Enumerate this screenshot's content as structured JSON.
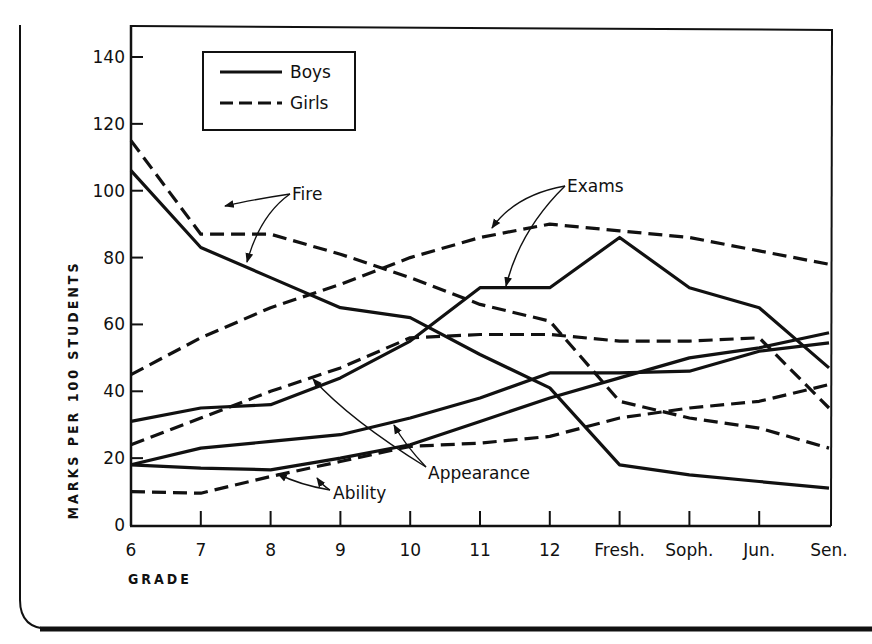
{
  "chart_data": {
    "type": "line",
    "title": "",
    "xlabel": "GRADE",
    "ylabel": "MARKS PER 100 STUDENTS",
    "ylim": [
      0,
      140
    ],
    "yticks": [
      0,
      20,
      40,
      60,
      80,
      100,
      120,
      140
    ],
    "categories": [
      "6",
      "7",
      "8",
      "9",
      "10",
      "11",
      "12",
      "Fresh.",
      "Soph.",
      "Jun.",
      "Sen."
    ],
    "grid": false,
    "legend": {
      "position": "upper-left",
      "entries": [
        {
          "label": "Boys",
          "style": "solid"
        },
        {
          "label": "Girls",
          "style": "dashed"
        }
      ]
    },
    "series": [
      {
        "name": "Fire (Boys)",
        "group": "Fire",
        "sex": "Boys",
        "style": "solid",
        "values": [
          106,
          83,
          74,
          65,
          62,
          51,
          41,
          18,
          15,
          13,
          11
        ]
      },
      {
        "name": "Fire (Girls)",
        "group": "Fire",
        "sex": "Girls",
        "style": "dashed",
        "values": [
          115,
          87,
          87,
          81,
          74,
          66,
          61,
          37,
          32,
          29,
          23
        ]
      },
      {
        "name": "Exams (Boys)",
        "group": "Exams",
        "sex": "Boys",
        "style": "solid",
        "values": [
          31,
          35,
          36,
          44,
          55,
          71,
          71,
          86,
          71,
          65,
          47
        ]
      },
      {
        "name": "Exams (Girls)",
        "group": "Exams",
        "sex": "Girls",
        "style": "dashed",
        "values": [
          45,
          56,
          65,
          72,
          80,
          86,
          90,
          88,
          86,
          82,
          78
        ]
      },
      {
        "name": "Appearance (Boys)",
        "group": "Appearance",
        "sex": "Boys",
        "style": "solid",
        "values": [
          18,
          23,
          25,
          27,
          32,
          38,
          45.5,
          45.5,
          46,
          52,
          54.5
        ]
      },
      {
        "name": "Appearance (Girls)",
        "group": "Appearance",
        "sex": "Girls",
        "style": "dashed",
        "values": [
          24,
          32,
          40,
          47,
          56,
          57,
          57,
          55,
          55,
          56,
          35
        ]
      },
      {
        "name": "Ability (Boys)",
        "group": "Ability",
        "sex": "Boys",
        "style": "solid",
        "values": [
          18,
          17,
          16.5,
          20,
          24,
          31,
          38,
          44,
          50,
          53,
          57.5
        ]
      },
      {
        "name": "Ability (Girls)",
        "group": "Ability",
        "sex": "Girls",
        "style": "dashed",
        "values": [
          10,
          9.5,
          14.5,
          19,
          23.5,
          24.5,
          26.5,
          32,
          35,
          37,
          42
        ]
      }
    ],
    "annotations": [
      {
        "text": "Fire",
        "targets": [
          "Fire (Girls)",
          "Fire (Boys)"
        ]
      },
      {
        "text": "Exams",
        "targets": [
          "Exams (Girls)",
          "Exams (Boys)"
        ]
      },
      {
        "text": "Appearance",
        "targets": [
          "Appearance (Girls)",
          "Appearance (Boys)"
        ]
      },
      {
        "text": "Ability",
        "targets": [
          "Ability (Boys)",
          "Ability (Girls)"
        ]
      }
    ]
  },
  "labels": {
    "y_title": "MARKS PER 100 STUDENTS",
    "x_title": "GRADE",
    "legend_boys": "Boys",
    "legend_girls": "Girls",
    "annot_fire": "Fire",
    "annot_exams": "Exams",
    "annot_appearance": "Appearance",
    "annot_ability": "Ability"
  },
  "colors": {
    "ink": "#111111",
    "background": "#ffffff"
  }
}
